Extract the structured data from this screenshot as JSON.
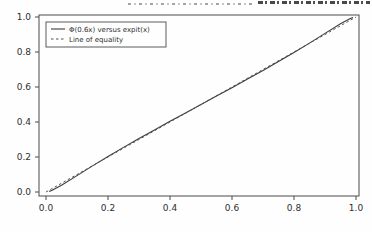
{
  "header": {
    "note": "cropped illegible text line at top edge"
  },
  "chart_data": {
    "type": "line",
    "title": "",
    "xlabel": "",
    "ylabel": "",
    "xlim": [
      0.0,
      1.0
    ],
    "ylim": [
      0.0,
      1.0
    ],
    "grid": false,
    "x_ticks": [
      "0.0",
      "0.2",
      "0.4",
      "0.6",
      "0.8",
      "1.0"
    ],
    "y_ticks": [
      "0.0",
      "0.2",
      "0.4",
      "0.6",
      "0.8",
      "1.0"
    ],
    "legend": {
      "position": "upper left",
      "entries": [
        {
          "label": "Φ(0.6x) versus expit(x)",
          "style": "solid"
        },
        {
          "label": "Line of equality",
          "style": "dashed"
        }
      ]
    },
    "series": [
      {
        "name": "Φ(0.6x) versus expit(x)",
        "style": "solid",
        "x": [
          0.01,
          0.02,
          0.05,
          0.1,
          0.15,
          0.2,
          0.25,
          0.3,
          0.35,
          0.4,
          0.45,
          0.5,
          0.55,
          0.6,
          0.65,
          0.7,
          0.75,
          0.8,
          0.85,
          0.9,
          0.95,
          0.98,
          0.99
        ],
        "y": [
          0.003,
          0.01,
          0.039,
          0.094,
          0.149,
          0.203,
          0.255,
          0.306,
          0.355,
          0.404,
          0.452,
          0.5,
          0.548,
          0.596,
          0.645,
          0.694,
          0.745,
          0.797,
          0.851,
          0.906,
          0.961,
          0.99,
          0.997
        ]
      },
      {
        "name": "Line of equality",
        "style": "dashed",
        "x": [
          0.0,
          1.0
        ],
        "y": [
          0.0,
          1.0
        ]
      }
    ],
    "colors": {
      "solid_line": "#3c3c3c",
      "dashed_line": "#555555",
      "frame": "#4b4b4b",
      "text": "#2e2e2e"
    }
  }
}
